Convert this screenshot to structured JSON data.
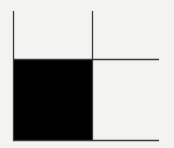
{
  "diagram": {
    "background": "#f3f3f1",
    "line_color": "#3a3a3a",
    "fill_color": "#000000",
    "filled_block": {
      "x": 13,
      "y": 59,
      "width": 79,
      "height": 81
    },
    "lines": [
      {
        "name": "left-vertical-line",
        "x1": 13.5,
        "y1": 11,
        "x2": 13.5,
        "y2": 141
      },
      {
        "name": "right-vertical-line",
        "x1": 92.5,
        "y1": 11,
        "x2": 92.5,
        "y2": 141
      },
      {
        "name": "top-horizontal-line",
        "x1": 13,
        "y1": 59.5,
        "x2": 159,
        "y2": 59.5
      },
      {
        "name": "bottom-horizontal-line",
        "x1": 13,
        "y1": 140.5,
        "x2": 159,
        "y2": 140.5
      }
    ]
  }
}
